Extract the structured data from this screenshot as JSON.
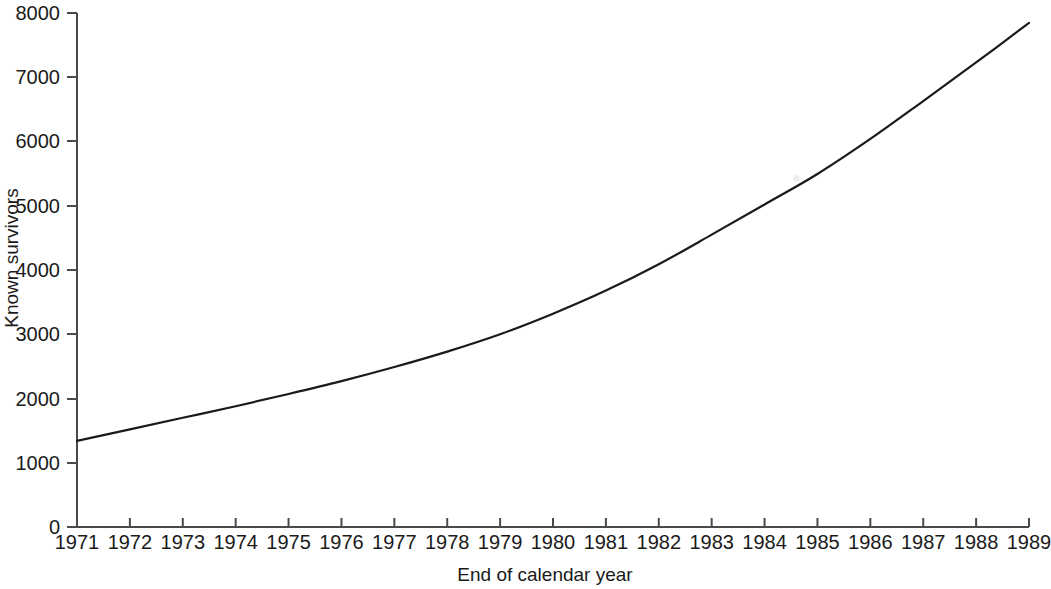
{
  "chart_data": {
    "type": "line",
    "title": "",
    "xlabel": "End of calendar year",
    "ylabel": "Known survivors",
    "xlim": [
      1971,
      1989
    ],
    "ylim": [
      0,
      8000
    ],
    "grid": false,
    "legend": null,
    "x_tick_labels": [
      "1971",
      "1972",
      "1973",
      "1974",
      "1975",
      "1976",
      "1977",
      "1978",
      "1979",
      "1980",
      "1981",
      "1982",
      "1983",
      "1984",
      "1985",
      "1986",
      "1987",
      "1988",
      "1989"
    ],
    "y_tick_labels": [
      "0",
      "1000",
      "2000",
      "3000",
      "4000",
      "5000",
      "6000",
      "7000",
      "8000"
    ],
    "y_ticks": [
      0,
      1000,
      2000,
      3000,
      4000,
      5000,
      6000,
      7000,
      8000
    ],
    "x": [
      1971,
      1972,
      1973,
      1974,
      1975,
      1976,
      1977,
      1978,
      1979,
      1980,
      1981,
      1982,
      1983,
      1984,
      1985,
      1986,
      1987,
      1988,
      1989
    ],
    "values": [
      1340,
      1520,
      1700,
      1880,
      2070,
      2270,
      2490,
      2730,
      3000,
      3320,
      3680,
      4090,
      4550,
      5020,
      5495,
      6040,
      6630,
      7230,
      7845
    ],
    "series": [
      {
        "name": "Known survivors",
        "values": [
          1340,
          1520,
          1700,
          1880,
          2070,
          2270,
          2490,
          2730,
          3000,
          3320,
          3680,
          4090,
          4550,
          5020,
          5495,
          6040,
          6630,
          7230,
          7845
        ]
      }
    ],
    "line_color": "#1a1a1a",
    "line_width": 2.2,
    "axis_color": "#4a4a4a",
    "marker_annotation": {
      "x": 1984.6,
      "y": 5430,
      "style": "small-light-gap"
    }
  }
}
